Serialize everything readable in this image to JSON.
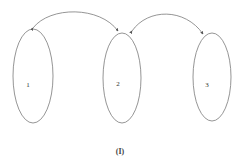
{
  "diagram": {
    "caption": "(I)",
    "stroke_color": "#7a7a7a",
    "nodes": [
      {
        "id": "1",
        "label": "1",
        "cx": 33,
        "cy": 76,
        "rx": 20,
        "ry": 47
      },
      {
        "id": "2",
        "label": "2",
        "cx": 122,
        "cy": 78,
        "rx": 19,
        "ry": 45
      },
      {
        "id": "3",
        "label": "3",
        "cx": 212,
        "cy": 77,
        "rx": 19,
        "ry": 44
      }
    ],
    "edges": [
      {
        "from": "2",
        "to": "1",
        "bidirectional": true
      },
      {
        "from": "2",
        "to": "3",
        "bidirectional": true
      }
    ]
  }
}
